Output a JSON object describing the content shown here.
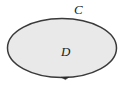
{
  "figure": {
    "background_color": "#ffffff",
    "width": 127,
    "height": 85,
    "labels": {
      "boundary_curve": "C",
      "region": "D"
    },
    "shapes": {
      "region_ellipse": {
        "name": "region-ellipse",
        "center_x": 62,
        "center_y": 48,
        "radius_x": 55,
        "radius_y": 30,
        "fill_color": "#e9e9e9",
        "stroke_color": "#3a3a3a",
        "stroke_width": 1.5
      },
      "orientation_marker": {
        "name": "orientation-arrow",
        "x": 65,
        "y": 77.5,
        "color": "#2b2b2b",
        "direction": "counterclockwise"
      }
    }
  }
}
